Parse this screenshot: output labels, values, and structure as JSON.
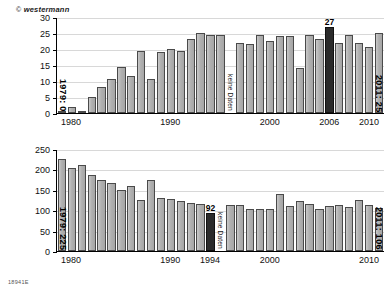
{
  "credit": {
    "symbol": "©",
    "text": "westermann"
  },
  "footer": {
    "code": "18941E"
  },
  "charts": [
    {
      "id": "top",
      "nodata_label": "keine Daten",
      "start_note": "1979: 0",
      "end_note": "2011: 25",
      "chart_data": {
        "type": "bar",
        "title": "",
        "xlabel": "",
        "ylabel": "",
        "ylim": [
          0,
          30
        ],
        "yticks": [
          0,
          5,
          10,
          15,
          20,
          25,
          30
        ],
        "grid": true,
        "legend": "none",
        "xticks": [
          1980,
          1990,
          2000,
          2006,
          2010
        ],
        "highlight_year": 2006,
        "highlight_label": "27",
        "missing_years": [
          1996
        ],
        "categories": [
          1979,
          1980,
          1981,
          1982,
          1983,
          1984,
          1985,
          1986,
          1987,
          1988,
          1989,
          1990,
          1991,
          1992,
          1993,
          1994,
          1995,
          1996,
          1997,
          1998,
          1999,
          2000,
          2001,
          2002,
          2003,
          2004,
          2005,
          2006,
          2007,
          2008,
          2009,
          2010,
          2011
        ],
        "values": [
          0,
          2,
          0.5,
          5,
          8,
          10.5,
          14.5,
          11.5,
          19.5,
          10.5,
          19,
          20,
          19.5,
          23,
          25,
          24.5,
          24.5,
          null,
          22,
          21.5,
          24.5,
          22.5,
          24,
          24,
          14,
          24.5,
          23,
          27,
          22,
          24.5,
          22,
          20.5,
          25
        ]
      }
    },
    {
      "id": "bottom",
      "nodata_label": "keine Daten",
      "start_note": "1979: 225",
      "end_note": "2011: 106",
      "chart_data": {
        "type": "bar",
        "title": "",
        "xlabel": "",
        "ylabel": "",
        "ylim": [
          0,
          250
        ],
        "yticks": [
          0,
          50,
          100,
          150,
          200,
          250
        ],
        "grid": true,
        "legend": "none",
        "xticks": [
          1980,
          1990,
          1994,
          2000,
          2010
        ],
        "highlight_year": 1994,
        "highlight_label": "92",
        "missing_years": [
          1995
        ],
        "categories": [
          1979,
          1980,
          1981,
          1982,
          1983,
          1984,
          1985,
          1986,
          1987,
          1988,
          1989,
          1990,
          1991,
          1992,
          1993,
          1994,
          1995,
          1996,
          1997,
          1998,
          1999,
          2000,
          2001,
          2002,
          2003,
          2004,
          2005,
          2006,
          2007,
          2008,
          2009,
          2010,
          2011
        ],
        "values": [
          225,
          203,
          210,
          186,
          173,
          166,
          149,
          160,
          126,
          174,
          130,
          128,
          123,
          118,
          115,
          92,
          null,
          113,
          112,
          104,
          102,
          104,
          140,
          110,
          122,
          115,
          104,
          111,
          112,
          108,
          125,
          113,
          106
        ]
      }
    }
  ]
}
